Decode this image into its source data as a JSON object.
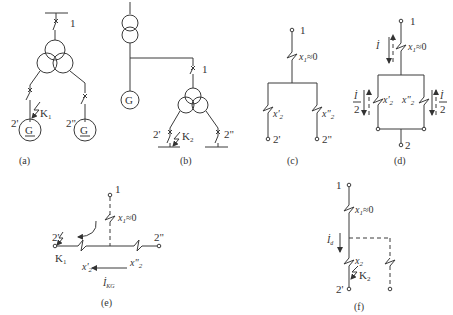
{
  "figure": {
    "panels": [
      {
        "id": "a",
        "caption": "(a)",
        "labels": {
          "node1": "1",
          "node2p": "2'",
          "node2pp": "2\"",
          "fault": "K",
          "fault_sub": "1",
          "gen": "G"
        }
      },
      {
        "id": "b",
        "caption": "(b)",
        "labels": {
          "node1": "1",
          "node2p": "2'",
          "node2pp": "2\"",
          "fault": "K",
          "fault_sub": "2",
          "gen": "G"
        }
      },
      {
        "id": "c",
        "caption": "(c)",
        "labels": {
          "node1": "1",
          "x1": "x",
          "x1_sub": "1",
          "x1_val": "≈0",
          "x2p": "x'",
          "x2p_sub": "2",
          "x2pp": "x\"",
          "x2pp_sub": "2",
          "node2p": "2'",
          "node2pp": "2\""
        }
      },
      {
        "id": "d",
        "caption": "(d)",
        "labels": {
          "node1": "1",
          "I": "İ",
          "x1": "x",
          "x1_sub": "1",
          "x1_val": "≈0",
          "half_num": "İ",
          "half_den": "2",
          "x2p": "x'",
          "x2p_sub": "2",
          "x2pp": "x\"",
          "x2pp_sub": "2",
          "node2": "2"
        }
      },
      {
        "id": "e",
        "caption": "(e)",
        "labels": {
          "node1": "1",
          "x1": "x",
          "x1_sub": "1",
          "x1_val": "≈0",
          "node2p": "2'",
          "node2pp": "2\"",
          "fault": "K",
          "fault_sub": "1",
          "x2p": "x'",
          "x2p_sub": "2",
          "x2pp": "x\"",
          "x2pp_sub": "2",
          "I": "İ",
          "I_sub": "KG"
        }
      },
      {
        "id": "f",
        "caption": "(f)",
        "labels": {
          "node1": "1",
          "x1": "x",
          "x1_sub": "1",
          "x1_val": "≈0",
          "I": "İ",
          "I_sub": "d",
          "x2": "x",
          "x2_sub": "2",
          "fault": "K",
          "fault_sub": "2",
          "node2p": "2'"
        }
      }
    ]
  }
}
